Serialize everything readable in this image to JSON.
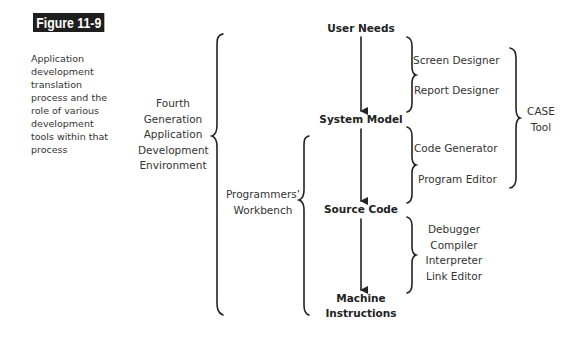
{
  "figure": {
    "label": "Figure 11-9",
    "caption": "Application development translation process and the role of various development tools within that process"
  },
  "groups": {
    "fourth_gen": [
      "Fourth",
      "Generation",
      "Application",
      "Development",
      "Environment"
    ],
    "workbench": [
      "Programmers’",
      "Workbench"
    ],
    "case_tool": [
      "CASE",
      "Tool"
    ]
  },
  "stages": {
    "user_needs": "User Needs",
    "system_model": "System Model",
    "source_code": "Source Code",
    "machine_instructions": [
      "Machine",
      "Instructions"
    ]
  },
  "tools": {
    "design": [
      "Screen Designer",
      "Report Designer"
    ],
    "coding": [
      "Code Generator",
      "Program Editor"
    ],
    "translation": [
      "Debugger",
      "Compiler",
      "Interpreter",
      "Link Editor"
    ]
  },
  "colors": {
    "label_bg": "#1e1e1e",
    "label_text": "#ffffff",
    "ink": "#222222"
  }
}
